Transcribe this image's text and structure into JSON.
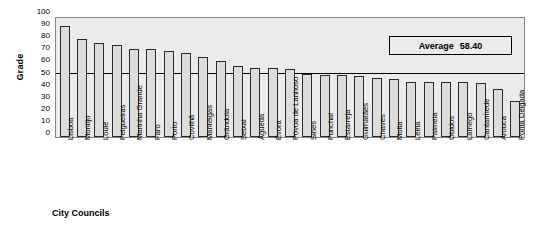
{
  "chart_data": {
    "type": "bar",
    "title": "",
    "xlabel": "City Councils",
    "ylabel": "Grade",
    "ylim": [
      0,
      100
    ],
    "ytick_step": 10,
    "yticks": [
      100,
      90,
      80,
      70,
      60,
      50,
      40,
      30,
      20,
      10,
      0
    ],
    "grid": false,
    "legend": "none",
    "bar_color": "#dcdcdc",
    "bar_border_color": "#2b2b2b",
    "plot_background": "#ebebeb",
    "annotations": [
      {
        "name": "average-box",
        "label": "Average",
        "value": "58.40",
        "numeric_value": 58.4
      }
    ],
    "reference_line": {
      "name": "average-line",
      "value": 54,
      "color": "#000000"
    },
    "categories": [
      "Lisboa",
      "Montijo",
      "Loule",
      "Felgueiras",
      "Marinha Grande",
      "Faro",
      "Porto",
      "Covilhã",
      "Manteigas",
      "Grândola",
      "Seixal",
      "Águeda",
      "Évora",
      "Póvoa de Lanhoso",
      "Sines",
      "Funchal",
      "Estarreja",
      "Guimarães",
      "Chaves",
      "Moita",
      "Leiria",
      "Palmela",
      "Óbidos",
      "Lamego",
      "Cantanhede",
      "Arouca",
      "Ponta Delgada"
    ],
    "values": [
      93,
      82,
      79,
      77,
      74,
      74,
      72,
      71,
      67,
      64,
      60,
      58,
      58,
      57,
      53,
      52,
      52,
      51,
      50,
      49,
      46,
      46,
      46,
      46,
      45,
      40,
      30
    ]
  }
}
